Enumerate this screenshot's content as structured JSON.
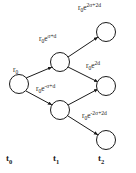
{
  "figure": {
    "type": "binomial-lattice-diagram",
    "background_color": "#ffffff",
    "stroke_color": "#1a1a1a",
    "text_color": "#1a1a1a"
  },
  "nodes": [
    {
      "id": "n0",
      "time_index": 0,
      "level": 0,
      "cx": 19,
      "cy": 84,
      "r": 9.5,
      "label_base": "r",
      "label_sub": "0",
      "label_exp": "",
      "label_x": 13,
      "label_y": 66,
      "label_anchor": "left"
    },
    {
      "id": "n1u",
      "time_index": 1,
      "level": 1,
      "cx": 60,
      "cy": 62,
      "r": 9.5,
      "label_base": "r",
      "label_sub": "0",
      "label_exp": "σ+d",
      "label_x": 39,
      "label_y": 35,
      "label_anchor": "left"
    },
    {
      "id": "n1d",
      "time_index": 1,
      "level": -1,
      "cx": 60,
      "cy": 110,
      "r": 9.5,
      "label_base": "r",
      "label_sub": "0",
      "label_exp": "-σ+d",
      "label_x": 36,
      "label_y": 85,
      "label_anchor": "left"
    },
    {
      "id": "n2u",
      "time_index": 2,
      "level": 2,
      "cx": 106,
      "cy": 32,
      "r": 9.5,
      "label_base": "r",
      "label_sub": "0",
      "label_exp": "2σ+2d",
      "label_x": 78,
      "label_y": 4,
      "label_anchor": "left"
    },
    {
      "id": "n2m",
      "time_index": 2,
      "level": 0,
      "cx": 106,
      "cy": 86,
      "r": 9.5,
      "label_base": "r",
      "label_sub": "0",
      "label_exp": "2d",
      "label_x": 86,
      "label_y": 62,
      "label_anchor": "left"
    },
    {
      "id": "n2d",
      "time_index": 2,
      "level": -2,
      "cx": 106,
      "cy": 140,
      "r": 9.5,
      "label_base": "r",
      "label_sub": "0",
      "label_exp": "-2σ+2d",
      "label_x": 82,
      "label_y": 112,
      "label_anchor": "left"
    }
  ],
  "edges": [
    {
      "id": "e0-1u",
      "from": "n0",
      "to": "n1u",
      "x1": 26,
      "y1": 78,
      "x2": 52,
      "y2": 67
    },
    {
      "id": "e0-1d",
      "from": "n0",
      "to": "n1d",
      "x1": 26,
      "y1": 91,
      "x2": 52,
      "y2": 105
    },
    {
      "id": "e1u-2u",
      "from": "n1u",
      "to": "n2u",
      "x1": 68,
      "y1": 57,
      "x2": 98,
      "y2": 37
    },
    {
      "id": "e1u-2m",
      "from": "n1u",
      "to": "n2m",
      "x1": 68,
      "y1": 67,
      "x2": 98,
      "y2": 82
    },
    {
      "id": "e1d-2m",
      "from": "n1d",
      "to": "n2m",
      "x1": 68,
      "y1": 105,
      "x2": 98,
      "y2": 89
    },
    {
      "id": "e1d-2d",
      "from": "n1d",
      "to": "n2d",
      "x1": 68,
      "y1": 116,
      "x2": 98,
      "y2": 135
    }
  ],
  "axis": {
    "labels": [
      {
        "id": "t0",
        "base": "t",
        "sub": "0",
        "x": 6,
        "y": 154
      },
      {
        "id": "t1",
        "base": "t",
        "sub": "1",
        "x": 53,
        "y": 154
      },
      {
        "id": "t2",
        "base": "t",
        "sub": "2",
        "x": 98,
        "y": 154
      }
    ]
  },
  "chart_data": {
    "type": "diagram",
    "title": "",
    "time_steps": [
      "t0",
      "t1",
      "t2"
    ],
    "values": [
      {
        "time": "t0",
        "level": 0,
        "expression": "r0"
      },
      {
        "time": "t1",
        "level": 1,
        "expression": "r0*e^(sigma+d)"
      },
      {
        "time": "t1",
        "level": -1,
        "expression": "r0*e^(-sigma+d)"
      },
      {
        "time": "t2",
        "level": 2,
        "expression": "r0*e^(2sigma+2d)"
      },
      {
        "time": "t2",
        "level": 0,
        "expression": "r0*e^(2d)"
      },
      {
        "time": "t2",
        "level": -2,
        "expression": "r0*e^(-2sigma+2d)"
      }
    ]
  }
}
